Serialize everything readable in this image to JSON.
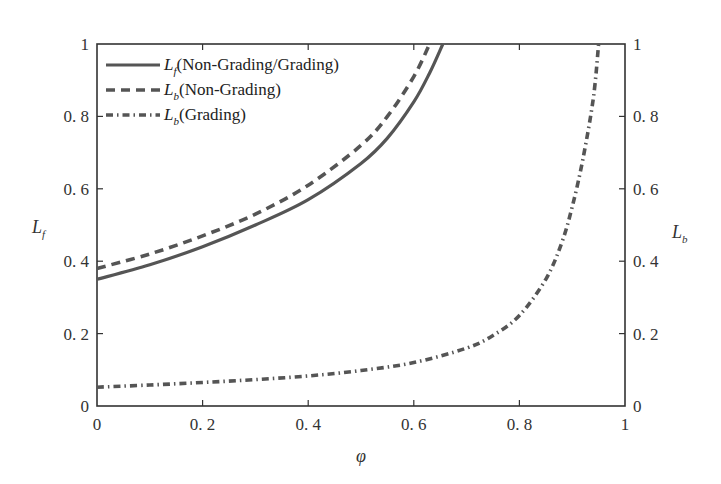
{
  "chart_data": {
    "type": "line",
    "title": "",
    "xlabel": "φ",
    "ylabel_left": "L_f",
    "ylabel_right": "L_b",
    "xlim": [
      0,
      1
    ],
    "ylim_left": [
      0,
      1
    ],
    "ylim_right": [
      0,
      1
    ],
    "x_ticks": [
      "0",
      "0.2",
      "0.4",
      "0.6",
      "0.8",
      "1"
    ],
    "y_ticks_left": [
      "0",
      "0.2",
      "0.4",
      "0.6",
      "0.8",
      "1"
    ],
    "y_ticks_right": [
      "0",
      "0.2",
      "0.4",
      "0.6",
      "0.8",
      "1"
    ],
    "grid": false,
    "legend_position": "upper left",
    "series": [
      {
        "name": "L_f (Non-Grading/Grading)",
        "legend_main": "L",
        "legend_sub": "f",
        "legend_rest": "(Non-Grading/Grading)",
        "style": "solid",
        "color": "#555555",
        "x": [
          0,
          0.1,
          0.2,
          0.3,
          0.4,
          0.5,
          0.55,
          0.6,
          0.63,
          0.655
        ],
        "y": [
          0.35,
          0.39,
          0.44,
          0.5,
          0.57,
          0.67,
          0.74,
          0.84,
          0.92,
          1.0
        ]
      },
      {
        "name": "L_b (Non-Grading)",
        "legend_main": "L",
        "legend_sub": "b",
        "legend_rest": "(Non-Grading)",
        "style": "dashed",
        "color": "#555555",
        "x": [
          0,
          0.1,
          0.2,
          0.3,
          0.4,
          0.5,
          0.55,
          0.6,
          0.63
        ],
        "y": [
          0.38,
          0.42,
          0.47,
          0.53,
          0.61,
          0.72,
          0.8,
          0.91,
          1.0
        ]
      },
      {
        "name": "L_b (Grading)",
        "legend_main": "L",
        "legend_sub": "b",
        "legend_rest": "(Grading)",
        "style": "dashdot",
        "color": "#555555",
        "x": [
          0,
          0.1,
          0.2,
          0.3,
          0.4,
          0.5,
          0.6,
          0.7,
          0.75,
          0.8,
          0.85,
          0.88,
          0.9,
          0.92,
          0.94,
          0.95
        ],
        "y": [
          0.052,
          0.058,
          0.065,
          0.073,
          0.083,
          0.098,
          0.12,
          0.16,
          0.195,
          0.25,
          0.35,
          0.45,
          0.55,
          0.68,
          0.85,
          1.0
        ]
      }
    ]
  }
}
